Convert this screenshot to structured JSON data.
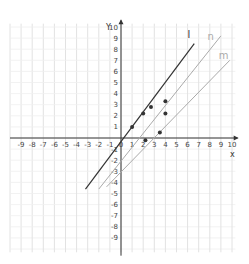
{
  "chart_data": {
    "type": "scatter",
    "title": "",
    "xlabel": "x",
    "ylabel": "y",
    "xlim": [
      -10,
      10
    ],
    "ylim": [
      -10,
      10
    ],
    "grid": true,
    "x_ticks": [
      -9,
      -8,
      -7,
      -6,
      -5,
      -4,
      -3,
      -2,
      -1,
      0,
      1,
      2,
      3,
      4,
      5,
      6,
      7,
      8,
      9,
      10
    ],
    "y_ticks": [
      -9,
      -8,
      -7,
      -6,
      -5,
      -4,
      -3,
      -2,
      -1,
      1,
      2,
      3,
      4,
      5,
      6,
      7,
      8,
      9,
      10
    ],
    "points": [
      {
        "x": 1,
        "y": 1
      },
      {
        "x": 2,
        "y": 2.2
      },
      {
        "x": 2.7,
        "y": 2.8
      },
      {
        "x": 4,
        "y": 3.3
      },
      {
        "x": 4,
        "y": 2.2
      },
      {
        "x": 3.5,
        "y": 0.5
      },
      {
        "x": 2.2,
        "y": -0.2
      }
    ],
    "lines": [
      {
        "name": "l",
        "color": "#333333",
        "from": [
          -3.2,
          -4.6
        ],
        "to": [
          6.6,
          8.5
        ],
        "label_pos": [
          6,
          9.0
        ]
      },
      {
        "name": "n",
        "color": "#aaaaaa",
        "from": [
          -2.0,
          -4.6
        ],
        "to": [
          9.0,
          9.2
        ],
        "label_pos": [
          7.8,
          8.8
        ]
      },
      {
        "name": "m",
        "color": "#aaaaaa",
        "from": [
          -1.3,
          -4.4
        ],
        "to": [
          9.8,
          7.0
        ],
        "label_pos": [
          8.8,
          7.1
        ]
      }
    ]
  },
  "axes": {
    "x_label": "x",
    "y_label": "Y",
    "origin_label": "0"
  },
  "layout": {
    "origin_px": [
      121,
      138
    ],
    "unit_px": 11.1,
    "grid_color": "#e2e2e2",
    "axis_color": "#333333",
    "point_color": "#333333"
  }
}
